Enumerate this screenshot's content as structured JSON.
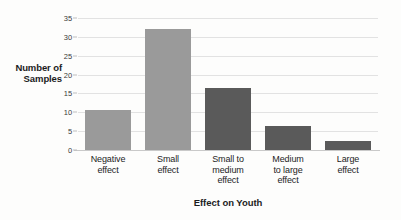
{
  "chart_data": {
    "type": "bar",
    "title": "",
    "xlabel": "Effect on Youth",
    "ylabel": "Number of Samples",
    "categories": [
      "Negative effect",
      "Small effect",
      "Small to medium effect",
      "Medium to large effect",
      "Large effect"
    ],
    "category_lines": [
      [
        "Negative",
        "effect"
      ],
      [
        "Small",
        "effect"
      ],
      [
        "Small to",
        "medium",
        "effect"
      ],
      [
        "Medium",
        "to large",
        "effect"
      ],
      [
        "Large",
        "effect"
      ]
    ],
    "values": [
      10.5,
      32,
      16.5,
      6.5,
      2.5
    ],
    "bar_colors": [
      "#9a9a9a",
      "#9a9a9a",
      "#5a5a5a",
      "#5a5a5a",
      "#5a5a5a"
    ],
    "ylim": [
      0,
      35
    ],
    "ytick_values": [
      0,
      5,
      10,
      15,
      20,
      25,
      30,
      35
    ],
    "ytick_labels": [
      "0",
      "5",
      "10",
      "15",
      "20",
      "25",
      "30",
      "35"
    ],
    "grid": true,
    "grid_axis": "y",
    "legend": false,
    "legend_position": "none",
    "background_color": "#fdfdfc",
    "gridline_color": "#e2e2e2",
    "baseline_color": "#c9c9c9"
  },
  "axes": {
    "y_title_lines": [
      "Number of",
      "Samples"
    ],
    "x_title": "Effect on Youth"
  }
}
